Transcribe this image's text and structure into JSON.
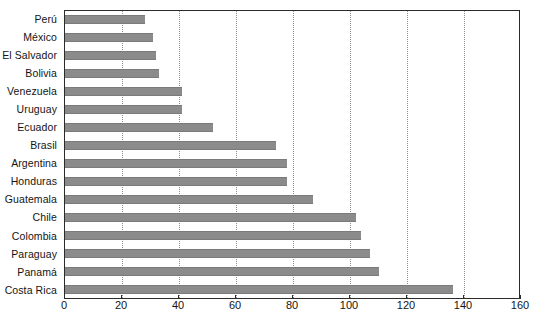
{
  "chart_data": {
    "type": "bar",
    "orientation": "horizontal",
    "title": "",
    "subtitle": "",
    "xlabel": "",
    "ylabel": "",
    "xlim": [
      0,
      160
    ],
    "ylim": null,
    "grid": true,
    "grid_axis": "x",
    "grid_style": "dotted",
    "legend": null,
    "legend_position": "none",
    "bar_color": "#8b8b8b",
    "axis_color": "#2b2b2b",
    "categories": [
      "Perú",
      "México",
      "El Salvador",
      "Bolivia",
      "Venezuela",
      "Uruguay",
      "Ecuador",
      "Brasil",
      "Argentina",
      "Honduras",
      "Guatemala",
      "Chile",
      "Colombia",
      "Paraguay",
      "Panamá",
      "Costa Rica"
    ],
    "values": [
      28,
      31,
      32,
      33,
      41,
      41,
      52,
      74,
      78,
      78,
      87,
      102,
      104,
      107,
      110,
      136
    ],
    "xticks": [
      0,
      20,
      40,
      60,
      80,
      100,
      120,
      140,
      160
    ],
    "xticklabels": [
      "0",
      "20",
      "40",
      "60",
      "80",
      "100",
      "120",
      "140",
      "160"
    ]
  }
}
